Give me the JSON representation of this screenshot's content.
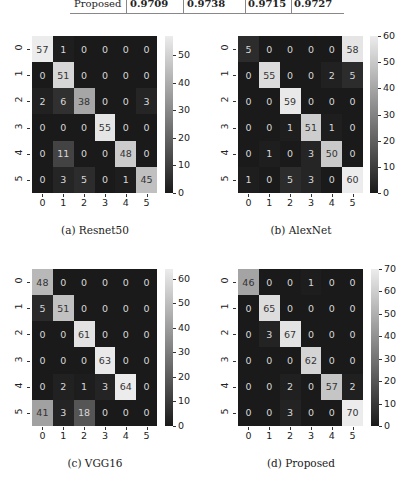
{
  "table_row": {
    "label": "Proposed",
    "values": [
      "0.9709",
      "0.9738",
      "0.9715",
      "0.9727"
    ]
  },
  "chart_data": [
    {
      "type": "heatmap",
      "title": "(a) Resnet50",
      "xlabel": "",
      "ylabel": "",
      "x_ticks": [
        "0",
        "1",
        "2",
        "3",
        "4",
        "5"
      ],
      "y_ticks": [
        "0",
        "1",
        "2",
        "3",
        "4",
        "5"
      ],
      "colorbar_ticks": [
        0,
        10,
        20,
        30,
        40,
        50
      ],
      "vmin": 0,
      "vmax": 57,
      "matrix": [
        [
          57,
          1,
          0,
          0,
          0,
          0
        ],
        [
          0,
          51,
          0,
          0,
          0,
          0
        ],
        [
          2,
          6,
          38,
          0,
          0,
          3
        ],
        [
          0,
          0,
          0,
          55,
          0,
          0
        ],
        [
          0,
          11,
          0,
          0,
          48,
          0
        ],
        [
          0,
          3,
          5,
          0,
          1,
          45
        ]
      ]
    },
    {
      "type": "heatmap",
      "title": "(b) AlexNet",
      "xlabel": "",
      "ylabel": "",
      "x_ticks": [
        "0",
        "1",
        "2",
        "3",
        "4",
        "5"
      ],
      "y_ticks": [
        "0",
        "1",
        "2",
        "3",
        "4",
        "5"
      ],
      "colorbar_ticks": [
        0,
        10,
        20,
        30,
        40,
        50,
        60
      ],
      "vmin": 0,
      "vmax": 60,
      "matrix": [
        [
          5,
          0,
          0,
          0,
          0,
          58
        ],
        [
          0,
          55,
          0,
          0,
          2,
          5
        ],
        [
          0,
          0,
          59,
          0,
          0,
          0
        ],
        [
          0,
          0,
          1,
          51,
          1,
          0
        ],
        [
          0,
          1,
          0,
          3,
          50,
          0
        ],
        [
          1,
          0,
          5,
          3,
          0,
          60
        ]
      ]
    },
    {
      "type": "heatmap",
      "title": "(c) VGG16",
      "xlabel": "",
      "ylabel": "",
      "x_ticks": [
        "0",
        "1",
        "2",
        "3",
        "4",
        "5"
      ],
      "y_ticks": [
        "0",
        "1",
        "2",
        "3",
        "4",
        "5"
      ],
      "colorbar_ticks": [
        0,
        10,
        20,
        30,
        40,
        50,
        60
      ],
      "vmin": 0,
      "vmax": 64,
      "matrix": [
        [
          48,
          0,
          0,
          0,
          0,
          0
        ],
        [
          5,
          51,
          0,
          0,
          0,
          0
        ],
        [
          0,
          0,
          61,
          0,
          0,
          0
        ],
        [
          0,
          0,
          0,
          63,
          0,
          0
        ],
        [
          0,
          2,
          1,
          3,
          64,
          0
        ],
        [
          41,
          3,
          18,
          0,
          0,
          0
        ]
      ]
    },
    {
      "type": "heatmap",
      "title": "(d) Proposed",
      "xlabel": "",
      "ylabel": "",
      "x_ticks": [
        "0",
        "1",
        "2",
        "3",
        "4",
        "5"
      ],
      "y_ticks": [
        "0",
        "1",
        "2",
        "3",
        "4",
        "5"
      ],
      "colorbar_ticks": [
        0,
        10,
        20,
        30,
        40,
        50,
        60,
        70
      ],
      "vmin": 0,
      "vmax": 70,
      "matrix": [
        [
          46,
          0,
          0,
          1,
          0,
          0
        ],
        [
          0,
          65,
          0,
          0,
          0,
          0
        ],
        [
          0,
          3,
          67,
          0,
          0,
          0
        ],
        [
          0,
          0,
          0,
          62,
          0,
          0
        ],
        [
          0,
          0,
          2,
          0,
          57,
          2
        ],
        [
          0,
          0,
          3,
          0,
          0,
          70
        ]
      ]
    }
  ],
  "colors": {
    "cmap_low": "#1a1a1a",
    "cmap_high": "#ececec",
    "text_on_dark": "#d8d8d8",
    "text_on_light": "#333333"
  }
}
